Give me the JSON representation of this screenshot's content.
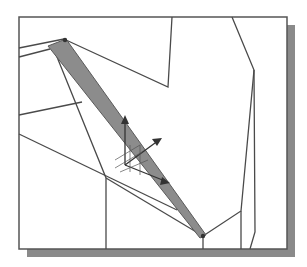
{
  "figure": {
    "colors": {
      "background": "#ffffff",
      "frame_border": "#555555",
      "frame_shadow": "#8a8a8a",
      "wire": "#4a4a4a",
      "selected_face": "#8c8c8c",
      "gizmo": "#333333"
    },
    "icons": {
      "gizmo": "triad-axis-icon"
    }
  }
}
